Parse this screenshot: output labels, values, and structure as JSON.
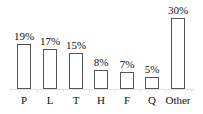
{
  "chart_data": {
    "type": "bar",
    "title": "",
    "xlabel": "",
    "ylabel": "",
    "categories": [
      "P",
      "L",
      "T",
      "H",
      "F",
      "Q",
      "Other"
    ],
    "values": [
      19,
      17,
      15,
      8,
      7,
      5,
      30
    ],
    "value_labels": [
      "19%",
      "17%",
      "15%",
      "8%",
      "7%",
      "5%",
      "30%"
    ],
    "unit": "%",
    "ylim": [
      0,
      30
    ],
    "grid": false,
    "legend": null,
    "bar_fill": "#ffffff",
    "bar_edge": "#555555"
  }
}
